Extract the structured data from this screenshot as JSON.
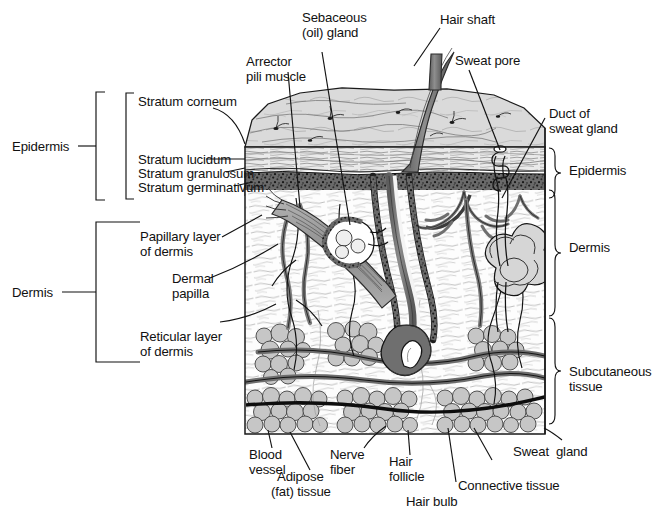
{
  "figure": {
    "type": "anatomical-cross-section",
    "view": "three-dimensional block / cutaway"
  },
  "left_brackets": {
    "epidermis": "Epidermis",
    "dermis": "Dermis"
  },
  "left_labels": {
    "stratum_corneum": "Stratum corneum",
    "stratum_lucidum": "Stratum lucidum",
    "stratum_granulosum": "Stratum granulosum",
    "stratum_germinativum": "Stratum germinativum",
    "papillary_layer_1": "Papillary layer",
    "papillary_layer_2": "of dermis",
    "dermal_papilla_1": "Dermal",
    "dermal_papilla_2": "papilla",
    "reticular_layer_1": "Reticular layer",
    "reticular_layer_2": "of dermis"
  },
  "top_labels": {
    "sebaceous_1": "Sebaceous",
    "sebaceous_2": "(oil) gland",
    "arrector_1": "Arrector",
    "arrector_2": "pili muscle",
    "hair_shaft": "Hair shaft",
    "sweat_pore": "Sweat pore"
  },
  "right_labels": {
    "duct_1": "Duct of",
    "duct_2": "sweat gland"
  },
  "right_brackets": {
    "epidermis": "Epidermis",
    "dermis": "Dermis",
    "subcutaneous_1": "Subcutaneous",
    "subcutaneous_2": "tissue"
  },
  "bottom_labels": {
    "blood_vessel_1": "Blood",
    "blood_vessel_2": "vessel",
    "adipose_1": "Adipose",
    "adipose_2": "(fat) tissue",
    "nerve_fiber_1": "Nerve",
    "nerve_fiber_2": "fiber",
    "hair_follicle_1": "Hair",
    "hair_follicle_2": "follicle",
    "hair_bulb": "Hair bulb",
    "connective_tissue": "Connective tissue",
    "sweat_gland": "Sweat  gland"
  },
  "colors": {
    "ink": "#111111",
    "surface_fill": "#d9d9d9",
    "papillary_fill": "#fbfbfb",
    "germinativum_fill": "#4a4a4a",
    "adipose_fill": "#c6c6c6",
    "hair_fill": "#7a7a7a",
    "vessel_fill": "#8d8d8d",
    "muscle_fill": "#9a9a9a",
    "background": "#ffffff"
  }
}
